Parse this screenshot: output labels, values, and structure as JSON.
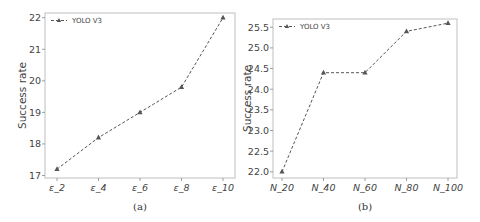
{
  "chart_data": [
    {
      "type": "line",
      "title": "",
      "caption": "(a)",
      "xlabel": "",
      "ylabel": "Success rate",
      "categories": [
        "ε_2",
        "ε_4",
        "ε_6",
        "ε_8",
        "ε_10"
      ],
      "series": [
        {
          "name": "YOLO V3",
          "values": [
            17.2,
            18.2,
            19.0,
            19.8,
            22.0
          ],
          "marker": "triangle",
          "linestyle": "dashed",
          "color": "#555555"
        }
      ],
      "yticks": [
        "17",
        "18",
        "19",
        "20",
        "21",
        "22"
      ],
      "ylim": [
        16.92,
        22.15
      ],
      "grid": false,
      "legend_position": "upper left"
    },
    {
      "type": "line",
      "title": "",
      "caption": "(b)",
      "xlabel": "",
      "ylabel": "Success rate",
      "categories": [
        "N_20",
        "N_40",
        "N_60",
        "N_80",
        "N_100"
      ],
      "series": [
        {
          "name": "YOLO V3",
          "values": [
            22.0,
            24.4,
            24.4,
            25.4,
            25.6
          ],
          "marker": "triangle",
          "linestyle": "dashed",
          "color": "#555555"
        }
      ],
      "yticks": [
        "22.0",
        "22.5",
        "23.0",
        "23.5",
        "24.0",
        "24.5",
        "25.0",
        "25.5"
      ],
      "ylim": [
        21.85,
        25.7
      ],
      "grid": false,
      "legend_position": "upper left"
    }
  ]
}
